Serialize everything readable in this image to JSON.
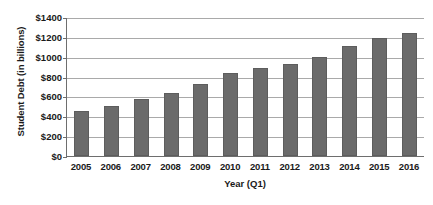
{
  "chart_data": {
    "type": "bar",
    "title": "",
    "xlabel": "Year (Q1)",
    "ylabel": "Student Debt (in billions)",
    "categories": [
      "2005",
      "2006",
      "2007",
      "2008",
      "2009",
      "2010",
      "2011",
      "2012",
      "2013",
      "2014",
      "2015",
      "2016"
    ],
    "values": [
      450,
      500,
      570,
      630,
      730,
      840,
      890,
      930,
      1000,
      1110,
      1190,
      1240
    ],
    "series": [
      {
        "name": "Student Debt",
        "values": [
          450,
          500,
          570,
          630,
          730,
          840,
          890,
          930,
          1000,
          1110,
          1190,
          1240
        ]
      }
    ],
    "ylim": [
      0,
      1400
    ],
    "ytick_values": [
      0,
      200,
      400,
      600,
      800,
      1000,
      1200,
      1400
    ],
    "ytick_labels": [
      "$0",
      "$200",
      "$400",
      "$600",
      "$800",
      "$1000",
      "$1200",
      "$1400"
    ],
    "grid": "horizontal",
    "legend": "none",
    "bar_color": "#6b6b6b",
    "gridline_color": "#a9a9a9",
    "axis_color": "#6e6e6e",
    "text_color": "#1a1a1a",
    "background": "#ffffff"
  }
}
